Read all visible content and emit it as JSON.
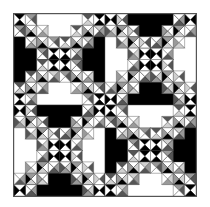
{
  "quilt": {
    "blocks_per_row": 2,
    "block_grid": 8,
    "colors": {
      "black": "#000000",
      "white": "#ffffff",
      "dark_gray": "#555555",
      "mid_gray": "#999999",
      "light_gray": "#d0d0d0",
      "line": "#444444"
    },
    "blocks": [
      {
        "position": "top-left",
        "black_triangles": "left-right"
      },
      {
        "position": "top-right",
        "black_triangles": "top-bottom"
      },
      {
        "position": "bottom-left",
        "black_triangles": "top-bottom"
      },
      {
        "position": "bottom-right",
        "black_triangles": "left-right"
      }
    ]
  }
}
